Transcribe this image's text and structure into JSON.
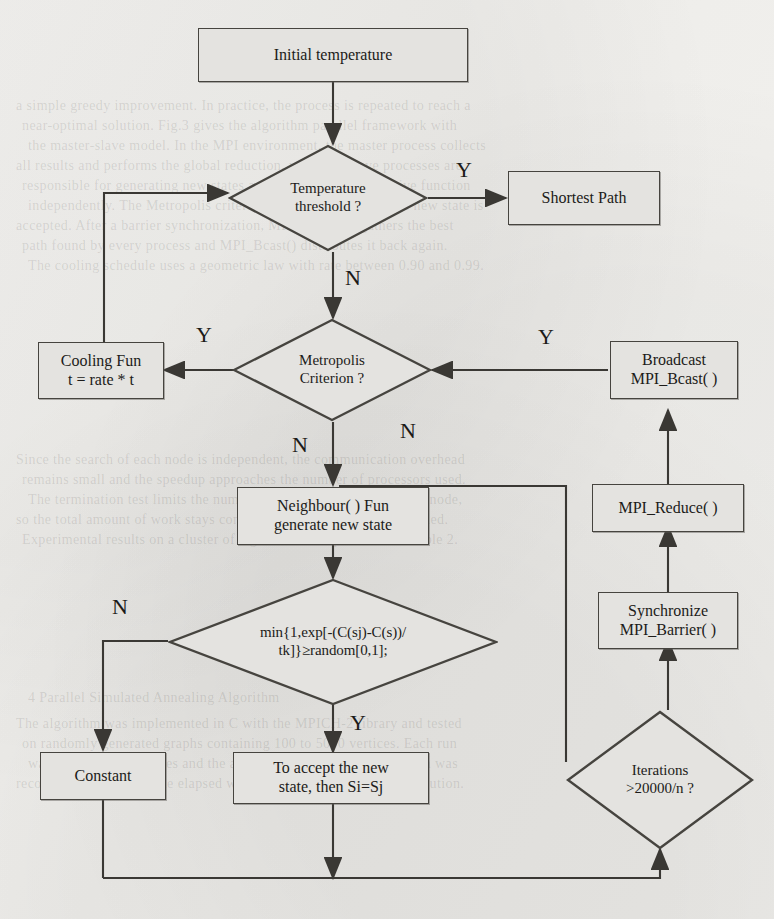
{
  "diagram": {
    "fill_color": "#e4e3e0",
    "stroke_color": "#46443f",
    "paper_color": "#f2f1ee"
  },
  "nodes": {
    "initial_temperature": "Initial temperature",
    "temperature_threshold_l1": "Temperature",
    "temperature_threshold_l2": "threshold ?",
    "shortest_path": "Shortest  Path",
    "cooling_fun_l1": "Cooling Fun",
    "cooling_fun_l2": "t = rate * t",
    "metropolis_l1": "Metropolis",
    "metropolis_l2": "Criterion ?",
    "broadcast_l1": "Broadcast",
    "broadcast_l2": "MPI_Bcast( )",
    "neighbour_l1": "Neighbour( ) Fun",
    "neighbour_l2": "generate new state",
    "mpi_reduce": "MPI_Reduce( )",
    "synchronize_l1": "Synchronize",
    "synchronize_l2": "MPI_Barrier( )",
    "min_formula_l1": "min{1,exp[-(C(sj)-C(s))/",
    "min_formula_l2": "tk]}≥random[0,1];",
    "iterations_l1": "Iterations",
    "iterations_l2": ">20000/n ?",
    "constant": "Constant",
    "accept_l1": "To accept the new",
    "accept_l2": "state, then Si=Sj"
  },
  "branch_labels": {
    "threshold_yes": "Y",
    "threshold_no": "N",
    "metropolis_yes_left": "Y",
    "metropolis_yes_right": "Y",
    "metropolis_no": "N",
    "iterations_no": "N",
    "min_no": "N",
    "min_yes": "Y"
  },
  "background_text": [
    "a simple greedy improvement. In practice, the process is repeated to reach a",
    "near-optimal solution. Fig.3 gives the algorithm parallel framework with",
    "the master-slave model. In the MPI environment, the master process collects",
    "all results and performs the global reduction, while the slave processes are",
    "responsible for generating new states and evaluating the objective function",
    "independently. The Metropolis criterion determines whether the new state is",
    "accepted. After a barrier synchronization, MPI_Reduce() gathers the best",
    "path found by every process and MPI_Bcast() distributes it back again.",
    "The cooling schedule uses a geometric law with rate between 0.90 and 0.99.",
    "Since the search of each node is independent, the communication overhead",
    "remains small and the speedup approaches the number of processors used.",
    "The termination test limits the number of iterations to 20000/n per node,",
    "so the total amount of work stays constant when n processors are added.",
    "Experimental results on a cluster of eight nodes are presented in Table 2.",
    "4  Parallel Simulated Annealing Algorithm",
    "The algorithm was implemented in C with the MPICH-2 library and tested",
    "on randomly generated graphs containing 100 to 5000 vertices. Each run",
    "was repeated thirty times and the average value of the shortest path was",
    "recorded together with the elapsed wall-clock time of the whole execution."
  ]
}
